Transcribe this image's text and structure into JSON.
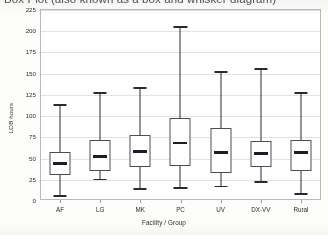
{
  "caption": "Box Plot (also known as a box and whisker diagram)",
  "chart_data": {
    "type": "box",
    "title": "Box Plot (also known as a box and whisker diagram)",
    "xlabel": "Facility / Group",
    "ylabel": "LOB hours",
    "ylim": [
      0,
      225
    ],
    "yticks": [
      0,
      25,
      50,
      75,
      100,
      125,
      150,
      175,
      200,
      225
    ],
    "ytick_labels": [
      "0",
      "25",
      "50",
      "75",
      "100",
      "125",
      "150",
      "175",
      "200",
      "225"
    ],
    "grid": true,
    "legend": "none",
    "categories": [
      "AF",
      "LG",
      "MK",
      "PC",
      "UV",
      "DX-VV",
      "Rural"
    ],
    "boxes": [
      {
        "label": "AF",
        "whisker_low": 6,
        "q1": 29,
        "median": 43,
        "q3": 57,
        "whisker_high": 113
      },
      {
        "label": "LG",
        "whisker_low": 25,
        "q1": 34,
        "median": 51,
        "q3": 71,
        "whisker_high": 127
      },
      {
        "label": "MK",
        "whisker_low": 14,
        "q1": 39,
        "median": 57,
        "q3": 76,
        "whisker_high": 133
      },
      {
        "label": "PC",
        "whisker_low": 15,
        "q1": 40,
        "median": 67,
        "q3": 97,
        "whisker_high": 205
      },
      {
        "label": "UV",
        "whisker_low": 17,
        "q1": 32,
        "median": 56,
        "q3": 85,
        "whisker_high": 152
      },
      {
        "label": "DX-VV",
        "whisker_low": 22,
        "q1": 39,
        "median": 55,
        "q3": 70,
        "whisker_high": 155
      },
      {
        "label": "Rural",
        "whisker_low": 8,
        "q1": 34,
        "median": 56,
        "q3": 71,
        "whisker_high": 127
      }
    ]
  }
}
